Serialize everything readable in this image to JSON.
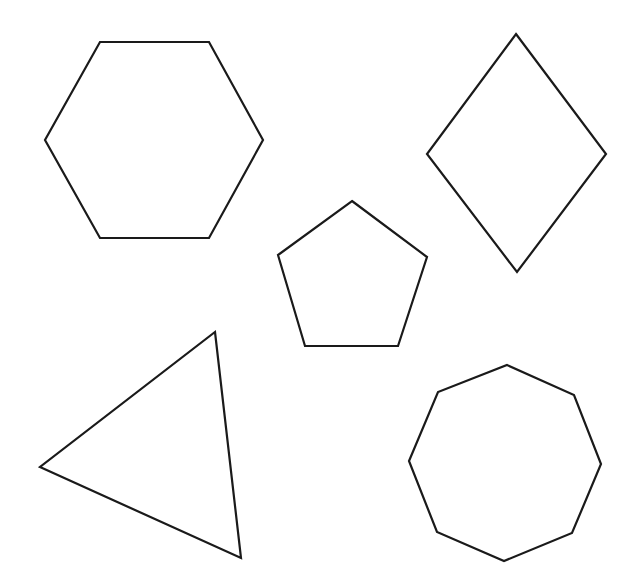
{
  "canvas": {
    "width": 636,
    "height": 588,
    "background": "#ffffff"
  },
  "style": {
    "stroke": "#1a1a1a",
    "stroke_width": 2.2
  },
  "shapes": [
    {
      "name": "hexagon",
      "sides": 6,
      "points": "100,42 209,42 263,140 209,238 100,238 45,140"
    },
    {
      "name": "rhombus",
      "sides": 4,
      "points": "516,34 606,154 517,272 427,154"
    },
    {
      "name": "pentagon",
      "sides": 5,
      "points": "352,201 427,257 398,346 305,346 278,255"
    },
    {
      "name": "triangle",
      "sides": 3,
      "points": "215,332 241,558 40,467"
    },
    {
      "name": "octagon",
      "sides": 8,
      "points": "507,365 574,395 601,464 572,533 504,561 437,532 409,461 438,392"
    }
  ]
}
